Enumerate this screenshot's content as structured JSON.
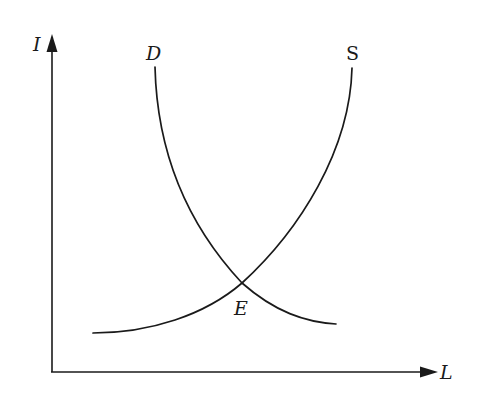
{
  "diagram": {
    "type": "supply-demand",
    "axes": {
      "y_label": "I",
      "x_label": "L"
    },
    "curves": [
      {
        "id": "demand",
        "label": "D",
        "shape": "downward-sloping convex"
      },
      {
        "id": "supply",
        "label": "S",
        "shape": "upward-sloping convex"
      }
    ],
    "equilibrium": {
      "label": "E"
    },
    "colors": {
      "ink": "#1a1a1a",
      "background": "#ffffff"
    }
  }
}
